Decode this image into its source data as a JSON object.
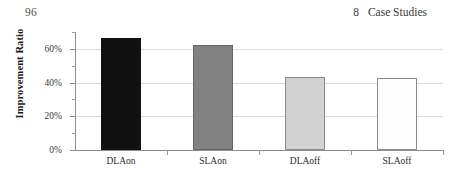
{
  "page_header": {
    "page_number": "96",
    "chapter_number": "8",
    "chapter_title": "Case Studies"
  },
  "chart_data": {
    "type": "bar",
    "title": "",
    "xlabel": "",
    "ylabel": "Improvement Ratio",
    "categories": [
      "DLAon",
      "SLAon",
      "DLAoff",
      "SLAoff"
    ],
    "values": [
      66.5,
      62.5,
      43.5,
      42.5
    ],
    "series": [
      {
        "name": "Improvement Ratio",
        "values": [
          66.5,
          62.5,
          43.5,
          42.5
        ]
      }
    ],
    "bar_colors": [
      "#111111",
      "#818181",
      "#d2d2d2",
      "#fdfdfd"
    ],
    "ylim": [
      0,
      70
    ],
    "ytick_values": [
      0,
      20,
      40,
      60
    ],
    "ytick_labels": [
      "0%",
      "20%",
      "40%",
      "60%"
    ],
    "yminor_tick_values": [
      10,
      30,
      50,
      70
    ],
    "grid": "horizontal",
    "legend": "none"
  }
}
